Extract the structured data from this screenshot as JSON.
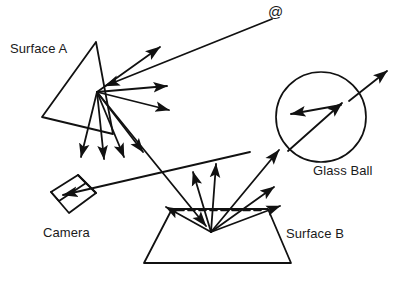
{
  "figure": {
    "type": "optics-light-transport-diagram",
    "background_color": "#ffffff",
    "line_color": "#111111",
    "width": 397,
    "height": 281
  },
  "labels": {
    "surface_a": "Surface A",
    "surface_b": "Surface B",
    "camera": "Camera",
    "glass_ball": "Glass Ball",
    "light_source_symbol": "@"
  },
  "elements": {
    "light_source": {
      "name": "light-source",
      "symbol": "@",
      "position": [
        275,
        14
      ]
    },
    "surface_a": {
      "name": "surface-a",
      "shape": "quadrilateral",
      "points": "96,42 113,134 42,117 96,42",
      "hub": [
        97,
        92
      ]
    },
    "surface_b": {
      "name": "surface-b",
      "shape": "trapezoid",
      "points": "172,209 268,209 291,263 144,263 172,209",
      "hub": [
        211,
        232
      ],
      "dashed_normal_line": "176,210 264,210"
    },
    "glass_ball": {
      "name": "glass-ball",
      "shape": "circle",
      "center": [
        321,
        117
      ],
      "radius": 45
    },
    "camera": {
      "name": "camera",
      "shape": "box",
      "front_face": "51,192 78,175 96,193 69,213 51,192",
      "depth_edges": "78,175 86,183 96,193 86,183 59,201 51,192"
    }
  },
  "rays": {
    "incident": [
      {
        "id": "source-to-surface-a",
        "from": [
          272,
          19
        ],
        "to": [
          102,
          87
        ],
        "arrowhead": true
      }
    ],
    "from_surface_a": [
      {
        "id": "a-specular-up-right",
        "from": [
          97,
          92
        ],
        "to": [
          163,
          44
        ],
        "arrowhead": true
      },
      {
        "id": "a-scatter-right-1",
        "from": [
          97,
          92
        ],
        "to": [
          170,
          85
        ],
        "arrowhead": true
      },
      {
        "id": "a-scatter-right-2",
        "from": [
          97,
          92
        ],
        "to": [
          172,
          110
        ],
        "arrowhead": true
      },
      {
        "id": "a-scatter-down-1",
        "from": [
          97,
          92
        ],
        "to": [
          80,
          160
        ],
        "arrowhead": true
      },
      {
        "id": "a-scatter-down-2",
        "from": [
          97,
          92
        ],
        "to": [
          104,
          162
        ],
        "arrowhead": true
      },
      {
        "id": "a-scatter-down-3",
        "from": [
          97,
          92
        ],
        "to": [
          124,
          160
        ],
        "arrowhead": true
      },
      {
        "id": "a-scatter-down-4",
        "from": [
          97,
          92
        ],
        "to": [
          144,
          155
        ],
        "arrowhead": true
      },
      {
        "id": "a-to-surface-b",
        "from": [
          97,
          92
        ],
        "to": [
          208,
          228
        ],
        "arrowhead": true
      }
    ],
    "to_camera": [
      {
        "id": "surface-b-to-camera",
        "from": [
          250,
          152
        ],
        "to": [
          60,
          196
        ],
        "arrowhead": true
      }
    ],
    "from_surface_b": [
      {
        "id": "b-to-upper-left",
        "from": [
          211,
          232
        ],
        "to": [
          163,
          205
        ],
        "arrowhead": true
      },
      {
        "id": "b-scatter-up-1",
        "from": [
          211,
          232
        ],
        "to": [
          192,
          168
        ],
        "arrowhead": true
      },
      {
        "id": "b-scatter-up-2",
        "from": [
          211,
          232
        ],
        "to": [
          215,
          160
        ],
        "arrowhead": true
      },
      {
        "id": "b-to-glass-ball",
        "from": [
          211,
          232
        ],
        "to": [
          282,
          146
        ],
        "arrowhead": true
      },
      {
        "id": "b-scatter-right-1",
        "from": [
          211,
          232
        ],
        "to": [
          277,
          184
        ],
        "arrowhead": true
      },
      {
        "id": "b-scatter-right-2",
        "from": [
          211,
          232
        ],
        "to": [
          283,
          205
        ],
        "arrowhead": true
      }
    ],
    "glass_ball_rays": [
      {
        "id": "ball-internal-refraction",
        "from": [
          288,
          151
        ],
        "to": [
          344,
          101
        ],
        "arrowhead": true
      },
      {
        "id": "ball-internal-back",
        "from": [
          341,
          104
        ],
        "to": [
          288,
          114
        ],
        "arrowhead": true
      },
      {
        "id": "ball-exit-upper-right",
        "from": [
          347,
          103
        ],
        "to": [
          389,
          70
        ],
        "arrowhead": true
      }
    ]
  }
}
